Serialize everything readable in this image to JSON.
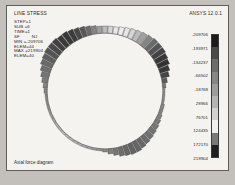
{
  "window": {
    "title": "LINE STRESS",
    "version_label": "ANSYS 12.0.1",
    "caption": "Axial force diagram",
    "background": "#f4f3f0",
    "border_color": "#5d5c59"
  },
  "info": {
    "lines": [
      "STEP=1",
      "SUB =6",
      "TIME=1",
      "SF         NJ",
      "MIN =-209706",
      "ELEM=44",
      "MAX =219904",
      "ELEM=40"
    ],
    "step": "1",
    "sub": "6",
    "time": "1",
    "component": "SF",
    "node": "NJ",
    "min_value": "-209706",
    "min_elem": "44",
    "max_value": "219904",
    "max_elem": "40"
  },
  "legend": {
    "labels": [
      "-209706",
      "-193971",
      "-134237",
      "-66502",
      "-18768",
      "28966",
      "76701",
      "124435",
      "172170",
      "219904"
    ],
    "band_colors": [
      "#1c1c1c",
      "#4a4a4a",
      "#6d6d6d",
      "#868686",
      "#9d9d9d",
      "#b5b5b5",
      "#d2d2d2",
      "#efefef",
      "#7a7a7a",
      "#1f1f1f"
    ]
  },
  "chart_data": {
    "type": "diagram",
    "title": "Axial force diagram",
    "subtitle": "LINE STRESS",
    "units": "force",
    "value_range": [
      -209706,
      219904
    ],
    "ring": {
      "center_x": 70,
      "center_y": 75,
      "radius": 58,
      "segment_count": 72,
      "description": "Circular ring of beam elements; radial bar length proportional to axial force magnitude, shaded by value."
    },
    "segments": [
      {
        "angle": 0,
        "magnitude": 2,
        "color": "#9a9a9a"
      },
      {
        "angle": 5,
        "magnitude": 2,
        "color": "#959595"
      },
      {
        "angle": 10,
        "magnitude": 2,
        "color": "#909090"
      },
      {
        "angle": 15,
        "magnitude": 3,
        "color": "#8a8a8a"
      },
      {
        "angle": 20,
        "magnitude": 3,
        "color": "#858585"
      },
      {
        "angle": 25,
        "magnitude": 4,
        "color": "#7f7f7f"
      },
      {
        "angle": 30,
        "magnitude": 5,
        "color": "#7a7a7a"
      },
      {
        "angle": 35,
        "magnitude": 6,
        "color": "#767676"
      },
      {
        "angle": 40,
        "magnitude": 7,
        "color": "#737373"
      },
      {
        "angle": 45,
        "magnitude": 8,
        "color": "#707070"
      },
      {
        "angle": 50,
        "magnitude": 9,
        "color": "#6c6c6c"
      },
      {
        "angle": 55,
        "magnitude": 10,
        "color": "#686868"
      },
      {
        "angle": 60,
        "magnitude": 11,
        "color": "#656565"
      },
      {
        "angle": 65,
        "magnitude": 11,
        "color": "#636363"
      },
      {
        "angle": 70,
        "magnitude": 10,
        "color": "#676767"
      },
      {
        "angle": 75,
        "magnitude": 9,
        "color": "#6d6d6d"
      },
      {
        "angle": 80,
        "magnitude": 7,
        "color": "#757575"
      },
      {
        "angle": 85,
        "magnitude": 5,
        "color": "#808080"
      },
      {
        "angle": 90,
        "magnitude": 3,
        "color": "#8d8d8d"
      },
      {
        "angle": 95,
        "magnitude": 2,
        "color": "#9a9a9a"
      },
      {
        "angle": 100,
        "magnitude": 2,
        "color": "#a4a4a4"
      },
      {
        "angle": 105,
        "magnitude": 2,
        "color": "#ababab"
      },
      {
        "angle": 110,
        "magnitude": 2,
        "color": "#b0b0b0"
      },
      {
        "angle": 115,
        "magnitude": 2,
        "color": "#b4b4b4"
      },
      {
        "angle": 120,
        "magnitude": 2,
        "color": "#b6b6b6"
      },
      {
        "angle": 125,
        "magnitude": 2,
        "color": "#b8b8b8"
      },
      {
        "angle": 130,
        "magnitude": 2,
        "color": "#b8b8b8"
      },
      {
        "angle": 135,
        "magnitude": 2,
        "color": "#b7b7b7"
      },
      {
        "angle": 140,
        "magnitude": 2,
        "color": "#b4b4b4"
      },
      {
        "angle": 145,
        "magnitude": 2,
        "color": "#b0b0b0"
      },
      {
        "angle": 150,
        "magnitude": 2,
        "color": "#aaaaaa"
      },
      {
        "angle": 155,
        "magnitude": 2,
        "color": "#a3a3a3"
      },
      {
        "angle": 160,
        "magnitude": 2,
        "color": "#9b9b9b"
      },
      {
        "angle": 165,
        "magnitude": 2,
        "color": "#959595"
      },
      {
        "angle": 170,
        "magnitude": 2,
        "color": "#909090"
      },
      {
        "angle": 175,
        "magnitude": 2,
        "color": "#8c8c8c"
      },
      {
        "angle": 180,
        "magnitude": 3,
        "color": "#888888"
      },
      {
        "angle": 185,
        "magnitude": 4,
        "color": "#828282"
      },
      {
        "angle": 190,
        "magnitude": 6,
        "color": "#7b7b7b"
      },
      {
        "angle": 195,
        "magnitude": 8,
        "color": "#757575"
      },
      {
        "angle": 200,
        "magnitude": 10,
        "color": "#707070"
      },
      {
        "angle": 205,
        "magnitude": 12,
        "color": "#6a6a6a"
      },
      {
        "angle": 210,
        "magnitude": 13,
        "color": "#5f5f5f"
      },
      {
        "angle": 215,
        "magnitude": 14,
        "color": "#545454"
      },
      {
        "angle": 220,
        "magnitude": 14,
        "color": "#4a4a4a"
      },
      {
        "angle": 225,
        "magnitude": 14,
        "color": "#414141"
      },
      {
        "angle": 230,
        "magnitude": 13,
        "color": "#3a3a3a"
      },
      {
        "angle": 235,
        "magnitude": 13,
        "color": "#373737"
      },
      {
        "angle": 240,
        "magnitude": 12,
        "color": "#3c3c3c"
      },
      {
        "angle": 245,
        "magnitude": 11,
        "color": "#474747"
      },
      {
        "angle": 250,
        "magnitude": 10,
        "color": "#575757"
      },
      {
        "angle": 255,
        "magnitude": 9,
        "color": "#6b6b6b"
      },
      {
        "angle": 260,
        "magnitude": 8,
        "color": "#848484"
      },
      {
        "angle": 265,
        "magnitude": 7,
        "color": "#a0a0a0"
      },
      {
        "angle": 270,
        "magnitude": 7,
        "color": "#bdbdbd"
      },
      {
        "angle": 275,
        "magnitude": 7,
        "color": "#d6d6d6"
      },
      {
        "angle": 280,
        "magnitude": 7,
        "color": "#e8e8e8"
      },
      {
        "angle": 285,
        "magnitude": 8,
        "color": "#ededed"
      },
      {
        "angle": 290,
        "magnitude": 9,
        "color": "#e6e6e6"
      },
      {
        "angle": 295,
        "magnitude": 10,
        "color": "#d5d5d5"
      },
      {
        "angle": 300,
        "magnitude": 11,
        "color": "#bcbcbc"
      },
      {
        "angle": 305,
        "magnitude": 12,
        "color": "#a1a1a1"
      },
      {
        "angle": 310,
        "magnitude": 13,
        "color": "#848484"
      },
      {
        "angle": 315,
        "magnitude": 14,
        "color": "#6a6a6a"
      },
      {
        "angle": 320,
        "magnitude": 14,
        "color": "#545454"
      },
      {
        "angle": 325,
        "magnitude": 14,
        "color": "#434343"
      },
      {
        "angle": 330,
        "magnitude": 13,
        "color": "#383838"
      },
      {
        "angle": 335,
        "magnitude": 12,
        "color": "#333333"
      },
      {
        "angle": 340,
        "magnitude": 10,
        "color": "#383838"
      },
      {
        "angle": 345,
        "magnitude": 8,
        "color": "#464646"
      },
      {
        "angle": 350,
        "magnitude": 5,
        "color": "#5c5c5c"
      },
      {
        "angle": 355,
        "magnitude": 3,
        "color": "#7a7a7a"
      }
    ]
  }
}
